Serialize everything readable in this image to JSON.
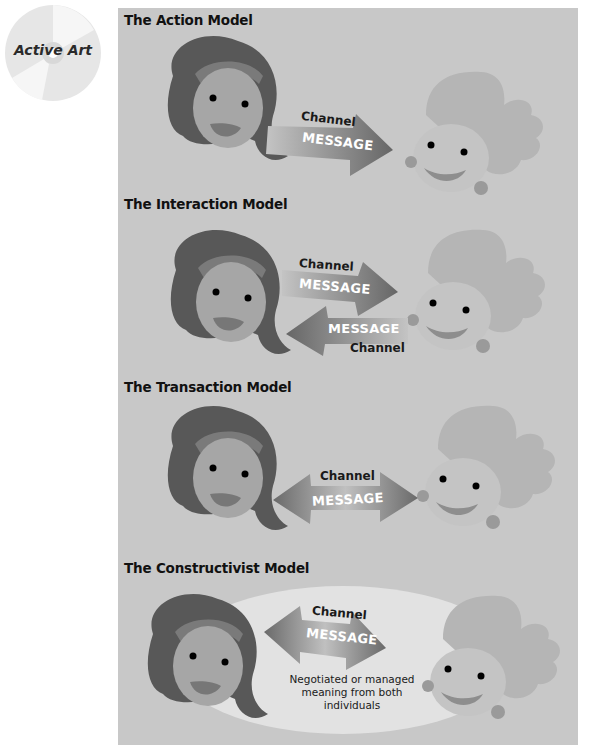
{
  "badge": {
    "label": "Active Art",
    "icon": "cd-disc-icon"
  },
  "colors": {
    "panel_bg": "#c8c8c8",
    "sender_hair": "#585858",
    "sender_headband": "#7a7a7a",
    "sender_skin": "#a6a6a6",
    "receiver_hair": "#b5b5b5",
    "receiver_skin": "#c4c4c4",
    "arrow_dark": "#6a6a6a",
    "arrow_light": "#bdbdbd",
    "ellipse": "#e2e2e2"
  },
  "sections": [
    {
      "title": "The Action Model",
      "arrows": [
        {
          "direction": "right",
          "channel_label": "Channel",
          "message_label": "MESSAGE"
        }
      ]
    },
    {
      "title": "The Interaction Model",
      "arrows": [
        {
          "direction": "right",
          "channel_label": "Channel",
          "message_label": "MESSAGE"
        },
        {
          "direction": "left",
          "channel_label": "Channel",
          "message_label": "MESSAGE"
        }
      ]
    },
    {
      "title": "The Transaction Model",
      "arrows": [
        {
          "direction": "both",
          "channel_label": "Channel",
          "message_label": "MESSAGE"
        }
      ]
    },
    {
      "title": "The Constructivist Model",
      "arrows": [
        {
          "direction": "both",
          "channel_label": "Channel",
          "message_label": "MESSAGE"
        }
      ],
      "note": "Negotiated or managed meaning from both individuals"
    }
  ]
}
